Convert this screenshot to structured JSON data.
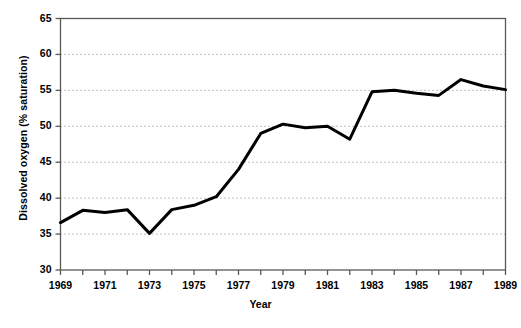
{
  "chart_data": {
    "type": "line",
    "title": "",
    "xlabel": "Year",
    "ylabel": "Dissolved oxygen (% saturation)",
    "x": [
      1969,
      1970,
      1971,
      1972,
      1973,
      1974,
      1975,
      1976,
      1977,
      1978,
      1979,
      1980,
      1981,
      1982,
      1983,
      1984,
      1985,
      1986,
      1987,
      1988,
      1989
    ],
    "values": [
      36.6,
      38.3,
      38.0,
      38.4,
      35.1,
      38.4,
      39.0,
      40.2,
      44.0,
      49.0,
      50.3,
      49.8,
      50.0,
      48.2,
      54.8,
      55.0,
      54.6,
      54.3,
      56.5,
      55.6,
      55.1
    ],
    "series": [
      {
        "name": "Dissolved oxygen",
        "values": [
          36.6,
          38.3,
          38.0,
          38.4,
          35.1,
          38.4,
          39.0,
          40.2,
          44.0,
          49.0,
          50.3,
          49.8,
          50.0,
          48.2,
          54.8,
          55.0,
          54.6,
          54.3,
          56.5,
          55.6,
          55.1
        ],
        "color": "#000000"
      }
    ],
    "xlim": [
      1969,
      1989
    ],
    "ylim": [
      30,
      65
    ],
    "y_ticks": [
      30,
      35,
      40,
      45,
      50,
      55,
      60,
      65
    ],
    "y_tick_labels": [
      "30",
      "35",
      "40",
      "45",
      "50",
      "55",
      "60",
      "65"
    ],
    "x_ticks": [
      1969,
      1970,
      1971,
      1972,
      1973,
      1974,
      1975,
      1976,
      1977,
      1978,
      1979,
      1980,
      1981,
      1982,
      1983,
      1984,
      1985,
      1986,
      1987,
      1988,
      1989
    ],
    "x_tick_labels_shown": [
      "1969",
      "1971",
      "1973",
      "1975",
      "1977",
      "1979",
      "1981",
      "1983",
      "1985",
      "1987",
      "1989"
    ],
    "grid": "horizontal-dotted",
    "legend": "none",
    "line_width": 3,
    "colors": {
      "line": "#000000",
      "axis": "#595959",
      "grid": "#808080",
      "background": "#ffffff",
      "text": "#000000"
    }
  }
}
